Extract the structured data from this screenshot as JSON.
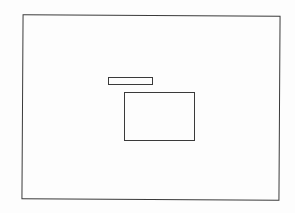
{
  "diagram": {
    "type": "wireframe-sketch",
    "style": "hand-drawn scanned outline",
    "stroke_color": "#3a3a3a",
    "background_color": "#fdfdfd",
    "elements": [
      {
        "name": "outer-frame",
        "shape": "rectangle",
        "label": ""
      },
      {
        "name": "bar",
        "shape": "rectangle",
        "label": ""
      },
      {
        "name": "panel",
        "shape": "rectangle",
        "label": ""
      }
    ]
  }
}
